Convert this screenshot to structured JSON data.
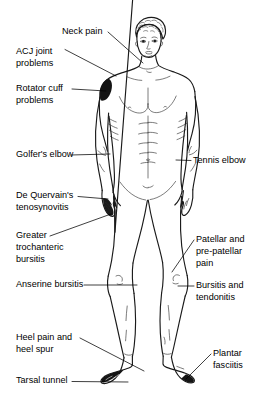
{
  "diagram": {
    "background_color": "#ffffff",
    "line_color": "#000000",
    "marker_color": "#141414",
    "labels_left": [
      {
        "id": "neck-pain",
        "text": "Neck pain",
        "lines": [
          "Neck pain"
        ],
        "x": 62,
        "y": 32,
        "leader_to_x": 143,
        "leader_to_y": 63
      },
      {
        "id": "acj-joint-problems",
        "text": "ACJ joint problems",
        "lines": [
          "ACJ joint",
          "problems"
        ],
        "x": 16,
        "y": 52,
        "leader_to_x": 116,
        "leader_to_y": 76
      },
      {
        "id": "rotator-cuff-problems",
        "text": "Rotator cuff problems",
        "lines": [
          "Rotator cuff",
          "problems"
        ],
        "x": 16,
        "y": 93,
        "leader_to_x": 106,
        "leader_to_y": 92
      },
      {
        "id": "golfers-elbow",
        "text": "Golfer's elbow",
        "lines": [
          "Golfer's elbow"
        ],
        "x": 16,
        "y": 155,
        "leader_to_x": 110,
        "leader_to_y": 154
      },
      {
        "id": "de-quervains-tenosynovitis",
        "text": "De Quervain's tenosynovitis",
        "lines": [
          "De Quervain's",
          "tenosynovitis"
        ],
        "x": 16,
        "y": 201,
        "leader_to_x": 108,
        "leader_to_y": 199
      },
      {
        "id": "greater-trochanteric-bursitis",
        "text": "Greater trochanteric bursitis",
        "lines": [
          "Greater",
          "trochanteric",
          "bursitis"
        ],
        "x": 16,
        "y": 240,
        "leader_to_x": 111,
        "leader_to_y": 216
      },
      {
        "id": "anserine-bursitis",
        "text": "Anserine bursitis",
        "lines": [
          "Anserine bursitis"
        ],
        "x": 16,
        "y": 285,
        "leader_to_x": 137,
        "leader_to_y": 285
      },
      {
        "id": "heel-pain-and-heel-spur",
        "text": "Heel pain and heel spur",
        "lines": [
          "Heel pain and",
          "heel spur"
        ],
        "x": 16,
        "y": 341,
        "leader_to_x": 144,
        "leader_to_y": 371
      },
      {
        "id": "tarsal-tunnel",
        "text": "Tarsal tunnel",
        "lines": [
          "Tarsal tunnel"
        ],
        "x": 16,
        "y": 381,
        "leader_to_x": 128,
        "leader_to_y": 382
      }
    ],
    "labels_right": [
      {
        "id": "tennis-elbow",
        "text": "Tennis elbow",
        "lines": [
          "Tennis elbow"
        ],
        "x": 193,
        "y": 161,
        "leader_to_x": 176,
        "leader_to_y": 160
      },
      {
        "id": "patellar-and-pre-patellar-pain",
        "text": "Patellar and pre-patellar pain",
        "lines": [
          "Patellar and",
          "pre-patellar",
          "pain"
        ],
        "x": 196,
        "y": 245,
        "leader_to_x": 172,
        "leader_to_y": 272
      },
      {
        "id": "bursitis-and-tendonitis",
        "text": "Bursitis and tendonitis",
        "lines": [
          "Bursitis and",
          "tendonitis"
        ],
        "x": 196,
        "y": 290,
        "leader_to_x": 178,
        "leader_to_y": 286
      },
      {
        "id": "plantar-fasciitis",
        "text": "Plantar fasciitis",
        "lines": [
          "Plantar",
          "fasciitis"
        ],
        "x": 213,
        "y": 358,
        "leader_to_x": 186,
        "leader_to_y": 379
      }
    ],
    "pain_site_markers": [
      {
        "id": "shoulder-marker",
        "region": "left shoulder / deltoid"
      },
      {
        "id": "wrist-hand-marker",
        "region": "right hand / wrist"
      },
      {
        "id": "foot-toe-marker",
        "region": "right foot / toes"
      },
      {
        "id": "heel-marker",
        "region": "right heel"
      }
    ]
  }
}
